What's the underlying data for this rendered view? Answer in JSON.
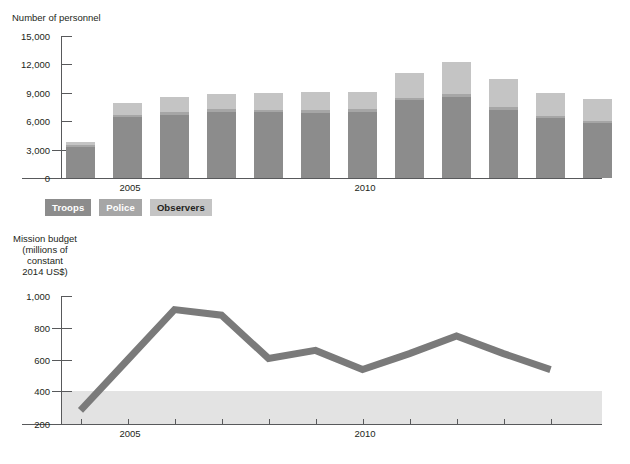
{
  "chart_data": [
    {
      "type": "bar",
      "id": "personnel",
      "title": "Number of personnel",
      "ylabel": "Number of personnel",
      "xlabel": "",
      "ylim": [
        0,
        15000
      ],
      "ytick_labels": [
        "15,000",
        "12,000",
        "9,000",
        "6,000",
        "3,000",
        "0"
      ],
      "yticks": [
        15000,
        12000,
        9000,
        6000,
        3000,
        0
      ],
      "grid": false,
      "legend_position": "below",
      "categories": [
        "2004",
        "2005",
        "2006",
        "2007",
        "2008",
        "2009",
        "2010",
        "2011",
        "2012",
        "2013",
        "2014"
      ],
      "xtick_labels_shown": [
        "2005",
        "2010"
      ],
      "xtick_label_positions": [
        1,
        6
      ],
      "stacked": true,
      "series": [
        {
          "name": "Troops",
          "color": "#8c8c8c",
          "values": [
            3300,
            6400,
            6700,
            7000,
            6950,
            6900,
            7000,
            8200,
            8600,
            7200,
            6300,
            5800
          ]
        },
        {
          "name": "Police",
          "color": "#a6a6a6",
          "values": [
            200,
            250,
            260,
            260,
            260,
            260,
            260,
            280,
            290,
            280,
            270,
            260
          ]
        },
        {
          "name": "Observers",
          "color": "#c4c4c4",
          "values": [
            300,
            1300,
            1600,
            1600,
            1800,
            1950,
            1800,
            2600,
            3400,
            3000,
            2450,
            2300
          ]
        }
      ],
      "totals": [
        3800,
        7950,
        8560,
        8860,
        9010,
        9110,
        9060,
        11080,
        12290,
        10480,
        9020,
        8360
      ]
    },
    {
      "type": "line",
      "id": "budget",
      "title": "Mission budget (millions of constant 2014 US$)",
      "ylabel": "Mission budget\n(millions of\nconstant\n2014 US$)",
      "xlabel": "",
      "ylim": [
        200,
        1000
      ],
      "ytick_labels": [
        "1,000",
        "800",
        "600",
        "400",
        "200"
      ],
      "yticks": [
        1000,
        800,
        600,
        400,
        200
      ],
      "grid": false,
      "shaded_band": {
        "from": 200,
        "to": 400,
        "color": "#e3e3e3"
      },
      "line_color": "#7a7a7a",
      "line_width": 7,
      "categories": [
        "2004",
        "2005",
        "2006",
        "2007",
        "2008",
        "2009",
        "2010",
        "2011",
        "2012",
        "2013",
        "2014"
      ],
      "xtick_labels_shown": [
        "2005",
        "2010"
      ],
      "xtick_label_positions": [
        1,
        6
      ],
      "x": [
        2004,
        2005,
        2006,
        2007,
        2008,
        2009,
        2010,
        2011,
        2012,
        2013,
        2014
      ],
      "values": [
        285,
        600,
        915,
        880,
        610,
        660,
        540,
        640,
        750,
        640,
        540
      ]
    }
  ],
  "top_chart": {
    "axis_title": "Number of personnel",
    "y_ticks": [
      "15,000",
      "12,000",
      "9,000",
      "6,000",
      "3,000",
      "0"
    ],
    "x_labels": [
      "2005",
      "2010"
    ],
    "legend": [
      {
        "label": "Troops",
        "tone": "dark",
        "color": "#8c8c8c"
      },
      {
        "label": "Police",
        "tone": "mid",
        "color": "#a6a6a6"
      },
      {
        "label": "Observers",
        "tone": "light",
        "color": "#c4c4c4"
      }
    ]
  },
  "bottom_chart": {
    "axis_title": "Mission budget\n(millions of\nconstant\n2014 US$)",
    "y_ticks": [
      "1,000",
      "800",
      "600",
      "400",
      "200"
    ],
    "x_labels": [
      "2005",
      "2010"
    ]
  }
}
